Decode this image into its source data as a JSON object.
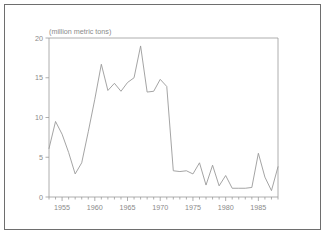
{
  "chart_data": {
    "type": "line",
    "title": "(million metric tons)",
    "xlabel": "",
    "ylabel": "",
    "ylim": [
      0,
      20
    ],
    "xlim": [
      1953,
      1988
    ],
    "yticks": [
      0,
      5,
      10,
      15,
      20
    ],
    "ytick_labels": [
      "0",
      "5",
      "10",
      "15",
      "20"
    ],
    "xticks": [
      1955,
      1960,
      1965,
      1970,
      1975,
      1980,
      1985
    ],
    "xtick_labels": [
      "1955",
      "1960",
      "1965",
      "1970",
      "1975",
      "1980",
      "1985"
    ],
    "minor_xticks_every": 1,
    "grid": false,
    "legend": null,
    "line_color": "#9a9a9a",
    "axis_color": "#9a9a9a",
    "x": [
      1953,
      1954,
      1955,
      1956,
      1957,
      1958,
      1959,
      1960,
      1961,
      1962,
      1963,
      1964,
      1965,
      1966,
      1967,
      1968,
      1969,
      1970,
      1971,
      1972,
      1973,
      1974,
      1975,
      1976,
      1977,
      1978,
      1979,
      1980,
      1981,
      1982,
      1983,
      1984,
      1985,
      1986,
      1987,
      1988
    ],
    "values": [
      6.1,
      9.5,
      7.9,
      5.6,
      2.9,
      4.3,
      8.2,
      12.3,
      16.7,
      13.4,
      14.3,
      13.3,
      14.4,
      15.0,
      19.0,
      13.2,
      13.3,
      14.8,
      13.9,
      3.3,
      3.2,
      3.3,
      2.9,
      4.3,
      1.5,
      4.0,
      1.4,
      2.7,
      1.1,
      1.1,
      1.1,
      1.2,
      5.5,
      2.5,
      0.8,
      3.8
    ],
    "series_name": "production"
  },
  "figure": {
    "unit_title": "(million metric tons)"
  }
}
